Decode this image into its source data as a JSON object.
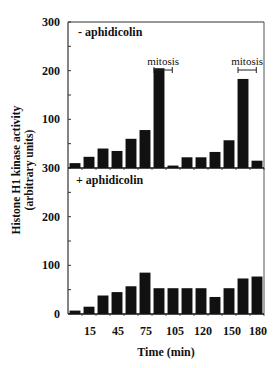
{
  "chart_data": {
    "type": "bar",
    "layout": "two vertically stacked panels sharing x-axis",
    "ylabel": "Histone H1 kinase activity",
    "ylabel_units": "(arbitrary units)",
    "xlabel": "Time (min)",
    "x_tick_labels": [
      "15",
      "45",
      "75",
      "105",
      "120",
      "150",
      "180"
    ],
    "ylim": [
      0,
      300
    ],
    "y_ticks": [
      "0",
      "100",
      "200",
      "300"
    ],
    "grid": false,
    "bar_color": "#111111",
    "panels": [
      {
        "label": "- aphidicolin",
        "y_tick_labels": [
          "300",
          "200",
          "100"
        ],
        "values": [
          10,
          23,
          40,
          35,
          60,
          78,
          205,
          5,
          22,
          22,
          33,
          57,
          183,
          15
        ],
        "annotations": [
          {
            "text": "mitosis",
            "bar_index_start": 6,
            "bar_index_end": 7
          },
          {
            "text": "mitosis",
            "bar_index_start": 12,
            "bar_index_end": 13
          }
        ]
      },
      {
        "label": "+ aphidicolin",
        "y_tick_labels": [
          "300",
          "200",
          "100",
          "0"
        ],
        "values": [
          7,
          15,
          38,
          45,
          57,
          85,
          53,
          53,
          53,
          53,
          35,
          53,
          73,
          77
        ],
        "annotations": []
      }
    ]
  },
  "labels": {
    "top_panel": "- aphidicolin",
    "bottom_panel": "+ aphidicolin",
    "mitosis_1": "mitosis",
    "mitosis_2": "mitosis",
    "ylabel_line1": "Histone H1 kinase activity",
    "ylabel_line2": "(arbitrary units)",
    "xlabel": "Time (min)"
  }
}
